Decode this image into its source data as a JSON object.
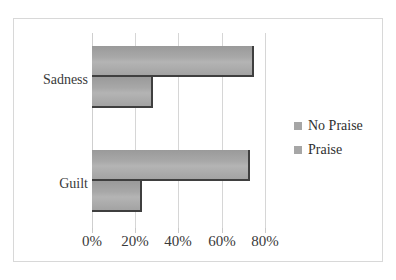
{
  "chart_data": {
    "type": "bar",
    "orientation": "horizontal",
    "title": "",
    "xlabel": "",
    "ylabel": "",
    "categories": [
      "Sadness",
      "Guilt"
    ],
    "series": [
      {
        "name": "No Praise",
        "values": [
          75,
          73
        ],
        "color": "#a6a6a6"
      },
      {
        "name": "Praise",
        "values": [
          28,
          23
        ],
        "color": "#a6a6a6"
      }
    ],
    "xlim": [
      0,
      80
    ],
    "xticks": [
      0,
      20,
      40,
      60,
      80
    ],
    "xtick_labels": [
      "0%",
      "20%",
      "40%",
      "60%",
      "80%"
    ],
    "grid": true,
    "legend_position": "right",
    "legend_entries": [
      "No Praise",
      "Praise"
    ]
  },
  "style": {
    "bar_fill": "#a8a8a8",
    "bar_edge": "#3f3f3f",
    "grid_color": "#d6d6d6",
    "frame_color": "#d8d8d8",
    "text_color": "#3a3a3a",
    "background": "#ffffff"
  }
}
